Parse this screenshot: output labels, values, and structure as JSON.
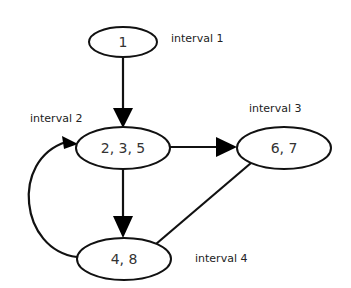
{
  "diagram": {
    "type": "flow-graph-intervals",
    "nodes": [
      {
        "id": "n1",
        "label": "1"
      },
      {
        "id": "n235",
        "label": "2, 3, 5"
      },
      {
        "id": "n67",
        "label": "6, 7"
      },
      {
        "id": "n48",
        "label": "4, 8"
      }
    ],
    "interval_labels": [
      {
        "id": "interval1",
        "text": "interval 1"
      },
      {
        "id": "interval2",
        "text": "interval 2"
      },
      {
        "id": "interval3",
        "text": "interval 3"
      },
      {
        "id": "interval4",
        "text": "interval 4"
      }
    ],
    "edges": [
      {
        "from": "1",
        "to": "2, 3, 5",
        "directed": true
      },
      {
        "from": "2, 3, 5",
        "to": "6, 7",
        "directed": true
      },
      {
        "from": "2, 3, 5",
        "to": "4, 8",
        "directed": true
      },
      {
        "from": "4, 8",
        "to": "2, 3, 5",
        "directed": true,
        "curved": true
      },
      {
        "from": "6, 7",
        "to": "4, 8",
        "directed": false
      }
    ],
    "colors": {
      "stroke": "#111111",
      "fill": "#ffffff",
      "text": "#333333"
    }
  }
}
